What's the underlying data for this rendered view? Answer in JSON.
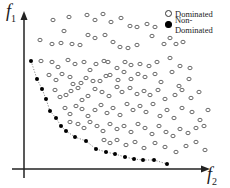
{
  "chart_data": {
    "type": "scatter",
    "title": "",
    "xlabel": "f2",
    "ylabel": "f1",
    "grid": false,
    "legend_position": "top-right",
    "legend": [
      {
        "label": "Dominated",
        "marker": "open-circle"
      },
      {
        "label": "Non-Dominated",
        "marker": "filled-circle"
      }
    ],
    "series": [
      {
        "name": "Non-Dominated",
        "marker": "filled-circle",
        "connected": true,
        "line_style": "dotted",
        "points_px": [
          [
            31,
            61
          ],
          [
            37,
            79
          ],
          [
            42,
            89
          ],
          [
            46,
            99
          ],
          [
            50,
            111
          ],
          [
            56,
            118
          ],
          [
            61,
            126
          ],
          [
            66,
            131
          ],
          [
            75,
            137
          ],
          [
            86,
            141
          ],
          [
            96,
            149
          ],
          [
            106,
            152
          ],
          [
            115,
            154
          ],
          [
            125,
            157
          ],
          [
            134,
            159
          ],
          [
            143,
            160
          ],
          [
            154,
            160
          ],
          [
            167,
            164
          ]
        ]
      },
      {
        "name": "Dominated",
        "marker": "open-circle",
        "points_px": [
          [
            53,
            20
          ],
          [
            69,
            17
          ],
          [
            87,
            15
          ],
          [
            95,
            20
          ],
          [
            103,
            14
          ],
          [
            111,
            22
          ],
          [
            121,
            18
          ],
          [
            130,
            26
          ],
          [
            137,
            27
          ],
          [
            147,
            24
          ],
          [
            155,
            27
          ],
          [
            170,
            38
          ],
          [
            40,
            40
          ],
          [
            52,
            44
          ],
          [
            61,
            43
          ],
          [
            64,
            31
          ],
          [
            72,
            44
          ],
          [
            80,
            45
          ],
          [
            88,
            35
          ],
          [
            95,
            38
          ],
          [
            105,
            35
          ],
          [
            113,
            42
          ],
          [
            120,
            47
          ],
          [
            128,
            48
          ],
          [
            137,
            45
          ],
          [
            152,
            36
          ],
          [
            164,
            44
          ],
          [
            176,
            44
          ],
          [
            183,
            42
          ],
          [
            41,
            61
          ],
          [
            52,
            62
          ],
          [
            58,
            67
          ],
          [
            68,
            60
          ],
          [
            75,
            64
          ],
          [
            84,
            62
          ],
          [
            90,
            70
          ],
          [
            96,
            64
          ],
          [
            104,
            61
          ],
          [
            108,
            62
          ],
          [
            117,
            68
          ],
          [
            125,
            62
          ],
          [
            131,
            65
          ],
          [
            140,
            64
          ],
          [
            149,
            66
          ],
          [
            157,
            62
          ],
          [
            170,
            58
          ],
          [
            180,
            66
          ],
          [
            190,
            68
          ],
          [
            49,
            75
          ],
          [
            56,
            80
          ],
          [
            62,
            74
          ],
          [
            70,
            77
          ],
          [
            73,
            84
          ],
          [
            81,
            83
          ],
          [
            86,
            78
          ],
          [
            93,
            81
          ],
          [
            100,
            81
          ],
          [
            106,
            76
          ],
          [
            110,
            75
          ],
          [
            118,
            80
          ],
          [
            124,
            72
          ],
          [
            131,
            79
          ],
          [
            138,
            74
          ],
          [
            145,
            77
          ],
          [
            155,
            74
          ],
          [
            161,
            82
          ],
          [
            172,
            72
          ],
          [
            179,
            86
          ],
          [
            189,
            79
          ],
          [
            55,
            90
          ],
          [
            60,
            97
          ],
          [
            66,
            95
          ],
          [
            71,
            91
          ],
          [
            78,
            88
          ],
          [
            82,
            100
          ],
          [
            88,
            96
          ],
          [
            95,
            89
          ],
          [
            102,
            92
          ],
          [
            109,
            96
          ],
          [
            117,
            87
          ],
          [
            122,
            92
          ],
          [
            130,
            88
          ],
          [
            137,
            94
          ],
          [
            144,
            91
          ],
          [
            150,
            95
          ],
          [
            158,
            90
          ],
          [
            165,
            99
          ],
          [
            175,
            95
          ],
          [
            182,
            90
          ],
          [
            191,
            98
          ],
          [
            199,
            92
          ],
          [
            65,
            108
          ],
          [
            70,
            114
          ],
          [
            76,
            106
          ],
          [
            82,
            109
          ],
          [
            88,
            116
          ],
          [
            95,
            110
          ],
          [
            101,
            105
          ],
          [
            107,
            113
          ],
          [
            113,
            108
          ],
          [
            120,
            115
          ],
          [
            127,
            104
          ],
          [
            133,
            110
          ],
          [
            140,
            106
          ],
          [
            146,
            112
          ],
          [
            153,
            104
          ],
          [
            160,
            116
          ],
          [
            167,
            110
          ],
          [
            174,
            118
          ],
          [
            182,
            108
          ],
          [
            192,
            112
          ],
          [
            200,
            120
          ],
          [
            208,
            110
          ],
          [
            70,
            122
          ],
          [
            78,
            124
          ],
          [
            84,
            128
          ],
          [
            90,
            122
          ],
          [
            97,
            126
          ],
          [
            103,
            131
          ],
          [
            110,
            124
          ],
          [
            117,
            129
          ],
          [
            124,
            126
          ],
          [
            131,
            132
          ],
          [
            138,
            124
          ],
          [
            145,
            128
          ],
          [
            152,
            134
          ],
          [
            159,
            126
          ],
          [
            166,
            132
          ],
          [
            173,
            136
          ],
          [
            180,
            129
          ],
          [
            188,
            133
          ],
          [
            196,
            128
          ],
          [
            204,
            126
          ],
          [
            104,
            140
          ],
          [
            110,
            143
          ],
          [
            117,
            140
          ],
          [
            126,
            145
          ],
          [
            135,
            142
          ],
          [
            144,
            148
          ],
          [
            155,
            143
          ],
          [
            165,
            147
          ],
          [
            176,
            152
          ],
          [
            186,
            146
          ],
          [
            196,
            142
          ],
          [
            205,
            150
          ]
        ]
      }
    ]
  },
  "axes": {
    "y_label_main": "f",
    "y_label_sub": "1",
    "x_label_main": "f",
    "x_label_sub": "2"
  },
  "legend": {
    "dominated_label": "Dominated",
    "non_dominated_label": "Non-Dominated"
  },
  "colors": {
    "axis": "#222222",
    "marker_open_stroke": "#444444",
    "marker_filled": "#000000",
    "front_line": "#666666"
  }
}
